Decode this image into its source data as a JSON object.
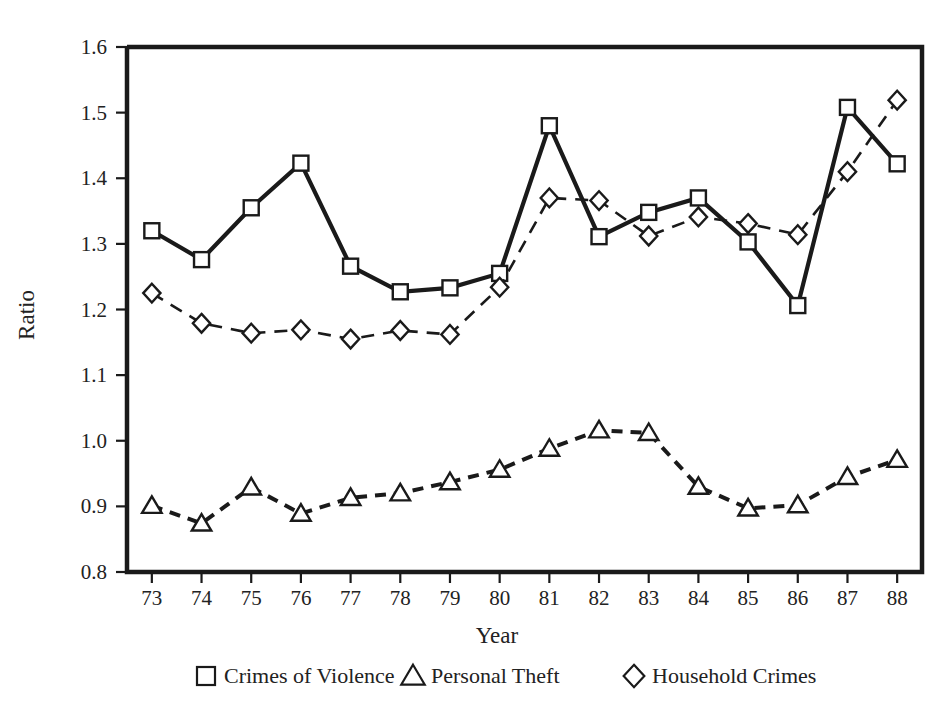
{
  "chart_data": {
    "type": "line",
    "title": "",
    "xlabel": "Year",
    "ylabel": "Ratio",
    "grid": false,
    "legend_position": "bottom",
    "categories": [
      "73",
      "74",
      "75",
      "76",
      "77",
      "78",
      "79",
      "80",
      "81",
      "82",
      "83",
      "84",
      "85",
      "86",
      "87",
      "88"
    ],
    "x": [
      73,
      74,
      75,
      76,
      77,
      78,
      79,
      80,
      81,
      82,
      83,
      84,
      85,
      86,
      87,
      88
    ],
    "xlim": [
      72.5,
      88.5
    ],
    "ylim": [
      0.8,
      1.6
    ],
    "ytick_labels": [
      "1.6",
      "1.5",
      "1.4",
      "1.3",
      "1.2",
      "1.1",
      "1.0",
      "0.9",
      "0.8"
    ],
    "yticks": [
      1.6,
      1.5,
      1.4,
      1.3,
      1.2,
      1.1,
      1.0,
      0.9,
      0.8
    ],
    "series": [
      {
        "name": "Crimes of Violence",
        "marker": "square",
        "line_style": "solid",
        "color": "#1a1a1a",
        "values": [
          1.32,
          1.276,
          1.355,
          1.423,
          1.266,
          1.227,
          1.233,
          1.255,
          1.48,
          1.311,
          1.348,
          1.37,
          1.303,
          1.206,
          1.508,
          1.422
        ]
      },
      {
        "name": "Personal Theft",
        "marker": "triangle",
        "line_style": "dashed",
        "color": "#1a1a1a",
        "values": [
          0.901,
          0.874,
          0.929,
          0.889,
          0.913,
          0.92,
          0.937,
          0.956,
          0.988,
          1.016,
          1.012,
          0.93,
          0.897,
          0.902,
          0.945,
          0.971
        ]
      },
      {
        "name": "Household Crimes",
        "marker": "diamond",
        "line_style": "dashed",
        "color": "#1a1a1a",
        "values": [
          1.225,
          1.179,
          1.164,
          1.169,
          1.155,
          1.168,
          1.162,
          1.234,
          1.37,
          1.366,
          1.312,
          1.341,
          1.331,
          1.314,
          1.41,
          1.519
        ]
      }
    ]
  },
  "legend": {
    "items": [
      {
        "label": "Crimes of Violence",
        "marker": "square"
      },
      {
        "label": "Personal Theft",
        "marker": "triangle"
      },
      {
        "label": "Household Crimes",
        "marker": "diamond"
      }
    ]
  }
}
